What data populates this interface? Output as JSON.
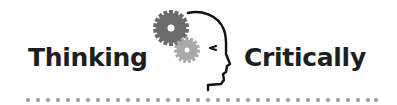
{
  "logo": {
    "word_left": "Thinking",
    "word_right": "Critically",
    "icon": "head-with-gears-icon"
  },
  "colors": {
    "text": "#1e1e1e",
    "gear_large": "#6b6b6b",
    "gear_small": "#a9a9a9",
    "outline": "#111111",
    "dots": "#9a9a9a",
    "background": "#ffffff"
  },
  "divider": {
    "style": "dotted",
    "dot_count": 36
  }
}
